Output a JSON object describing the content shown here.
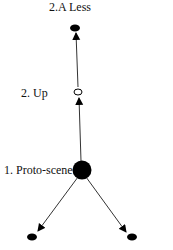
{
  "diagram": {
    "nodes": [
      {
        "id": "less",
        "label": "2.A Less",
        "style": "filled-small"
      },
      {
        "id": "up",
        "label": "2. Up",
        "style": "open-small"
      },
      {
        "id": "proto",
        "label": "1. Proto-scene",
        "style": "filled-large"
      },
      {
        "id": "bottom-left",
        "label": "",
        "style": "filled-small"
      },
      {
        "id": "bottom-right",
        "label": "",
        "style": "filled-small"
      }
    ],
    "edges": [
      {
        "from": "proto",
        "to": "up"
      },
      {
        "from": "up",
        "to": "less"
      },
      {
        "from": "proto",
        "to": "bottom-left"
      },
      {
        "from": "proto",
        "to": "bottom-right"
      }
    ],
    "colors": {
      "ink": "#000000",
      "background": "#ffffff"
    }
  }
}
